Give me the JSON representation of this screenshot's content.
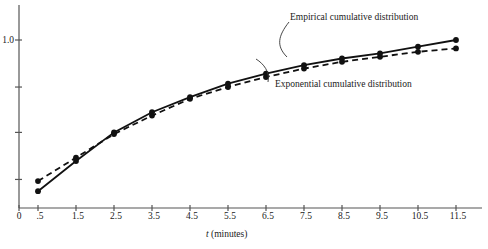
{
  "chart_data": {
    "type": "line",
    "title": "",
    "subtitle": "",
    "xlabel": "t (minutes)",
    "ylabel": "",
    "x": [
      0.5,
      1.5,
      2.5,
      3.5,
      4.5,
      5.5,
      6.5,
      7.5,
      8.5,
      9.5,
      10.5,
      11.5
    ],
    "xlim": [
      0,
      12.4
    ],
    "ylim": [
      0,
      1.22
    ],
    "grid": false,
    "legend_position": "inline-annotations",
    "x_tick_labels": [
      "0",
      ".5",
      "1.5",
      "2.5",
      "3.5",
      "4.5",
      "5.5",
      "6.5",
      "7.5",
      "8.5",
      "9.5",
      "10.5",
      "11.5"
    ],
    "x_tick_values": [
      0,
      0.5,
      1.5,
      2.5,
      3.5,
      4.5,
      5.5,
      6.5,
      7.5,
      8.5,
      9.5,
      10.5,
      11.5
    ],
    "y_tick_labels": [
      "1.0",
      "",
      "",
      ""
    ],
    "y_tick_values": [
      1.0,
      0.72,
      0.45,
      0.17
    ],
    "series": [
      {
        "name": "Empirical cumulative distribution",
        "style": "solid",
        "marker": "filled-circle",
        "color": "#111111",
        "values": [
          0.1,
          0.28,
          0.45,
          0.57,
          0.66,
          0.74,
          0.8,
          0.85,
          0.89,
          0.92,
          0.96,
          1.0
        ]
      },
      {
        "name": "Exponential cumulative distribution",
        "style": "dashed",
        "marker": "filled-circle",
        "color": "#111111",
        "values": [
          0.16,
          0.3,
          0.44,
          0.55,
          0.65,
          0.72,
          0.78,
          0.83,
          0.87,
          0.9,
          0.93,
          0.95
        ]
      }
    ],
    "annotations": [
      {
        "text": "Empirical cumulative distribution",
        "target_x": 7.5,
        "target_series": 0
      },
      {
        "text": "Exponential cumulative distribution",
        "target_x": 6.5,
        "target_series": 1
      }
    ]
  },
  "axes": {
    "x_title": "t (minutes)",
    "x_title_italic_part": "t",
    "x_title_rest": " (minutes)",
    "y_label_top": "1.0",
    "origin_label": "0"
  },
  "labels": {
    "x0": "0",
    "x1": ".5",
    "x2": "1.5",
    "x3": "2.5",
    "x4": "3.5",
    "x5": "4.5",
    "x6": "5.5",
    "x7": "6.5",
    "x8": "7.5",
    "x9": "8.5",
    "x10": "9.5",
    "x11": "10.5",
    "x12": "11.5"
  },
  "annotations": {
    "empirical": "Empirical cumulative distribution",
    "exponential": "Exponential cumulative distribution"
  },
  "colors": {
    "line": "#111111",
    "axis": "#555555",
    "text": "#1a1a1a",
    "background": "#ffffff"
  }
}
